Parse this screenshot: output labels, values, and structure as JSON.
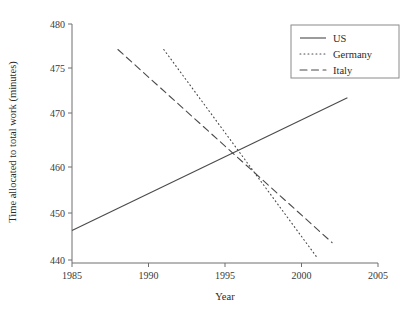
{
  "chart_data": {
    "type": "line",
    "title": "",
    "xlabel": "Year",
    "ylabel": "Time allocated to total work (minutes)",
    "xlim": [
      1985,
      2005
    ],
    "ylim": [
      440,
      480
    ],
    "x_ticks": [
      1985,
      1990,
      1995,
      2000,
      2005
    ],
    "x_tick_labels": [
      "1985",
      "1990",
      "1995",
      "2000",
      "2005"
    ],
    "y_ticks": [
      440,
      450,
      460,
      470,
      475,
      480
    ],
    "y_tick_labels": [
      "440",
      "450",
      "460",
      "470",
      "475",
      "480"
    ],
    "y_axis_scale": "non-uniform (5-unit steps above 470, 10-unit steps below)",
    "grid": false,
    "legend_position": "top-right",
    "series": [
      {
        "name": "US",
        "style": "solid",
        "x": [
          1985,
          2003
        ],
        "values": [
          446.3,
          471.7
        ]
      },
      {
        "name": "Germany",
        "style": "dotted",
        "x": [
          1991,
          2001
        ],
        "values": [
          477.1,
          440.6
        ]
      },
      {
        "name": "Italy",
        "style": "dashed",
        "x": [
          1988,
          2002
        ],
        "values": [
          477.1,
          443.7
        ]
      }
    ]
  },
  "legend": {
    "entries": [
      {
        "label": "US",
        "style": "solid"
      },
      {
        "label": "Germany",
        "style": "dotted"
      },
      {
        "label": "Italy",
        "style": "dashed"
      }
    ]
  },
  "colors": {
    "line": "#4a4a4a",
    "axis": "#6e6e6e",
    "text": "#2b2b2b",
    "background": "#ffffff"
  }
}
